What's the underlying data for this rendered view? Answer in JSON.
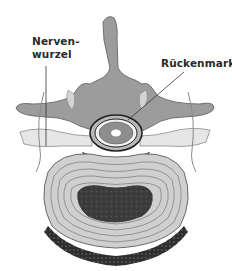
{
  "diagram": {
    "labels": {
      "nerve_root_line1": "Nerven-",
      "nerve_root_line2": "wurzel",
      "spinal_cord": "Rückenmark"
    },
    "colors": {
      "bone": "#9a9a9a",
      "bone_edge": "#6a6a6a",
      "disc_ring": "#c8c8c8",
      "nucleus": "#3e3e3e",
      "endplate": "#2a2a2a",
      "nerve": "#e2e2e2",
      "cord": "#8c8c8c"
    }
  }
}
